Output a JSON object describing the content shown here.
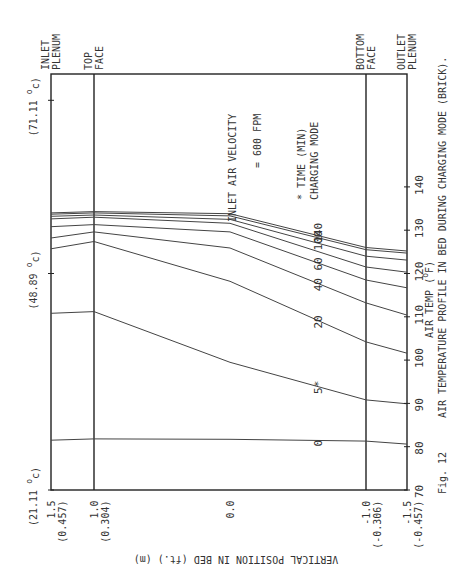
{
  "chart_data": {
    "type": "line",
    "orientation": "rotated-90-ccw",
    "fig_label": "Fig. 12",
    "caption": "AIR TEMPERATURE PROFILE IN BED DURING CHARGING MODE (BRICK).",
    "xlabel": "VERTICAL POSITION IN BED (ft.) (m)",
    "ylabel": "AIR TEMP (°F)",
    "ylabel_main": "AIR TEMP (",
    "ylabel_unit_sup": "o",
    "ylabel_unit": "F)",
    "x_range": [
      1.5,
      -1.5
    ],
    "y_range": [
      70,
      166
    ],
    "x_ticks": [
      {
        "value": 1.5,
        "label": "1.5",
        "sublabel": "(0.457)"
      },
      {
        "value": 1.0,
        "label": "1.0",
        "sublabel": "(0.304)"
      },
      {
        "value": 0.0,
        "label": "0.0",
        "sublabel": ""
      },
      {
        "value": -1.0,
        "label": "-1.0",
        "sublabel": "(-0.306)"
      },
      {
        "value": -1.5,
        "label": "-1.5",
        "sublabel": "(-0.457)"
      }
    ],
    "y_ticks": [
      70,
      80,
      90,
      100,
      110,
      120,
      130,
      140
    ],
    "y_ticks_celsius": [
      {
        "value_f": 70,
        "label": "(21.11 ",
        "sup": "o",
        "unit": "c)"
      },
      {
        "value_f": 120,
        "label": "(48.89 ",
        "sup": "o",
        "unit": "c)"
      },
      {
        "value_f": 160,
        "label": "(71.11 ",
        "sup": "o",
        "unit": "c)"
      }
    ],
    "region_labels": [
      {
        "at": 1.5,
        "line1": "INLET",
        "line2": "PLENUM"
      },
      {
        "at": 1.0,
        "line1": "TOP",
        "line2": "FACE"
      },
      {
        "at": -1.0,
        "line1": "BOTTOM",
        "line2": "FACE"
      },
      {
        "at": -1.5,
        "line1": "OUTLET",
        "line2": "PLENUM"
      }
    ],
    "annotations": {
      "velocity_line1": "INLET AIR VELOCITY",
      "velocity_line2": "= 600 FPM",
      "note_line1": "* TIME (MIN)",
      "note_line2": "CHARGING MODE"
    },
    "x": [
      1.5,
      1.0,
      0.0,
      -1.0,
      -1.5
    ],
    "series": [
      {
        "name": "0",
        "label": "0",
        "labeled": true,
        "values": [
          81.5,
          81.8,
          81.7,
          81.3,
          80.6
        ]
      },
      {
        "name": "5",
        "label": "5*",
        "labeled": true,
        "values": [
          110.8,
          111.2,
          99.5,
          90.8,
          89.9
        ]
      },
      {
        "name": "20",
        "label": "20",
        "labeled": true,
        "values": [
          125.7,
          127.4,
          118.2,
          104.2,
          101.6
        ]
      },
      {
        "name": "40",
        "label": "40",
        "labeled": true,
        "values": [
          128.2,
          129.6,
          125.9,
          113.2,
          110.4
        ]
      },
      {
        "name": "60",
        "label": "60",
        "labeled": true,
        "values": [
          130.8,
          131.3,
          129.6,
          118.5,
          116.7
        ]
      },
      {
        "name": "80",
        "label": "",
        "labeled": false,
        "values": [
          132.6,
          133.0,
          131.6,
          121.5,
          120.3
        ]
      },
      {
        "name": "100",
        "label": "100",
        "labeled": true,
        "values": [
          133.2,
          133.5,
          132.5,
          124.0,
          123.1
        ]
      },
      {
        "name": "120",
        "label": "",
        "labeled": false,
        "values": [
          133.7,
          134.0,
          133.3,
          125.5,
          124.7
        ]
      },
      {
        "name": "140",
        "label": "140",
        "labeled": true,
        "values": [
          134.0,
          134.3,
          133.8,
          126.0,
          125.2
        ]
      }
    ]
  }
}
